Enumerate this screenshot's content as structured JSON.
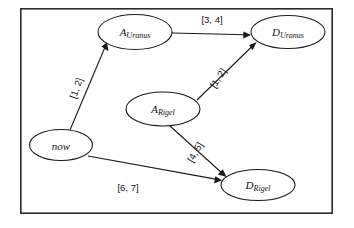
{
  "diagram": {
    "frame": {
      "x": 20,
      "y": 8,
      "width": 313,
      "height": 206,
      "stroke": "#2b2b2b"
    },
    "colors": {
      "stroke": "#1a1a1a",
      "node_fill": "#ffffff",
      "background": "#ffffff",
      "text": "#111111"
    },
    "nodes": [
      {
        "id": "now",
        "label": "now",
        "base": "now",
        "sub": "",
        "cx": 61,
        "cy": 145,
        "rx": 32,
        "ry": 16
      },
      {
        "id": "a-uranus",
        "label": "A_Uranus",
        "base": "A",
        "sub": "Uranus",
        "cx": 135,
        "cy": 32,
        "rx": 37,
        "ry": 18
      },
      {
        "id": "d-uranus",
        "label": "D_Uranus",
        "base": "D",
        "sub": "Uranus",
        "cx": 288,
        "cy": 32,
        "rx": 37,
        "ry": 17
      },
      {
        "id": "a-rigel",
        "label": "A_Rigel",
        "base": "A",
        "sub": "Rigel",
        "cx": 163,
        "cy": 109,
        "rx": 37,
        "ry": 17
      },
      {
        "id": "d-rigel",
        "label": "D_Rigel",
        "base": "D",
        "sub": "Rigel",
        "cx": 258,
        "cy": 185,
        "rx": 37,
        "ry": 16
      }
    ],
    "edges": [
      {
        "id": "now-to-a-uranus",
        "from": "now",
        "to": "a-uranus",
        "label": "[1, 2]",
        "label_x": 76,
        "label_y": 88,
        "label_rotation": -71,
        "x1": 70,
        "y1": 130,
        "x2": 107,
        "y2": 43
      },
      {
        "id": "a-uranus-to-d-uranus",
        "from": "a-uranus",
        "to": "d-uranus",
        "label": "[3, 4]",
        "label_x": 212,
        "label_y": 19,
        "label_rotation": 0,
        "x1": 172,
        "y1": 33,
        "x2": 250,
        "y2": 35
      },
      {
        "id": "a-rigel-to-d-uranus",
        "from": "a-rigel",
        "to": "d-uranus",
        "label": "[1, 2]",
        "label_x": 218,
        "label_y": 78,
        "label_rotation": -57,
        "x1": 197,
        "y1": 100,
        "x2": 256,
        "y2": 42
      },
      {
        "id": "a-rigel-to-d-rigel",
        "from": "a-rigel",
        "to": "d-rigel",
        "label": "[4, 5]",
        "label_x": 195,
        "label_y": 152,
        "label_rotation": -60,
        "x1": 170,
        "y1": 126,
        "x2": 226,
        "y2": 176
      },
      {
        "id": "now-to-d-rigel",
        "from": "now",
        "to": "d-rigel",
        "label": "[6, 7]",
        "label_x": 128,
        "label_y": 187,
        "label_rotation": 0,
        "x1": 88,
        "y1": 156,
        "x2": 221,
        "y2": 180
      }
    ]
  }
}
